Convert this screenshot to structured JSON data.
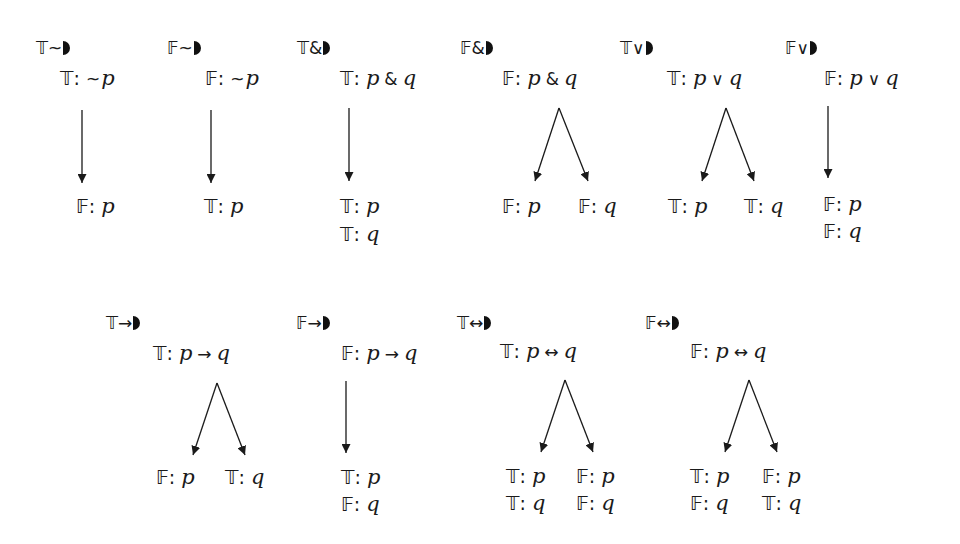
{
  "diagram": {
    "rules": [
      {
        "name": "T~",
        "sign": "𝕋",
        "connective": "~",
        "label_pos": [
          36,
          40
        ],
        "premise": {
          "sign": "𝕋",
          "text": "~p",
          "parts": [
            {
              "t": "~",
              "k": "op0"
            },
            {
              "t": "p",
              "k": "var"
            }
          ],
          "pos": [
            60,
            68
          ]
        },
        "branch": "linear",
        "arrow": {
          "x": 82,
          "y1": 110,
          "y2": 183
        },
        "conclusions": [
          {
            "sign": "𝔽",
            "var": "p",
            "pos": [
              76,
              196
            ]
          }
        ]
      },
      {
        "name": "F~",
        "sign": "𝔽",
        "connective": "~",
        "label_pos": [
          167,
          40
        ],
        "premise": {
          "sign": "𝔽",
          "text": "~p",
          "parts": [
            {
              "t": "~",
              "k": "op0"
            },
            {
              "t": "p",
              "k": "var"
            }
          ],
          "pos": [
            205,
            68
          ]
        },
        "branch": "linear",
        "arrow": {
          "x": 211,
          "y1": 110,
          "y2": 183
        },
        "conclusions": [
          {
            "sign": "𝕋",
            "var": "p",
            "pos": [
              204,
              196
            ]
          }
        ]
      },
      {
        "name": "T&",
        "sign": "𝕋",
        "connective": "&",
        "label_pos": [
          297,
          40
        ],
        "premise": {
          "sign": "𝕋",
          "text": "p & q",
          "parts": [
            {
              "t": "p",
              "k": "var"
            },
            {
              "t": "&",
              "k": "op"
            },
            {
              "t": "q",
              "k": "var"
            }
          ],
          "pos": [
            340,
            68
          ]
        },
        "branch": "linear",
        "arrow": {
          "x": 349,
          "y1": 108,
          "y2": 181
        },
        "conclusions": [
          {
            "sign": "𝕋",
            "var": "p",
            "pos": [
              340,
              196
            ]
          },
          {
            "sign": "𝕋",
            "var": "q",
            "pos": [
              340,
              224
            ]
          }
        ]
      },
      {
        "name": "F&",
        "sign": "𝔽",
        "connective": "&",
        "label_pos": [
          460,
          40
        ],
        "premise": {
          "sign": "𝔽",
          "text": "p & q",
          "parts": [
            {
              "t": "p",
              "k": "var"
            },
            {
              "t": "&",
              "k": "op"
            },
            {
              "t": "q",
              "k": "var"
            }
          ],
          "pos": [
            502,
            68
          ]
        },
        "branch": "split",
        "fork": {
          "apex": [
            559,
            108
          ],
          "left": [
            535,
            181
          ],
          "right": [
            588,
            181
          ]
        },
        "conclusions": [
          {
            "sign": "𝔽",
            "var": "p",
            "pos": [
              502,
              196
            ]
          },
          {
            "sign": "𝔽",
            "var": "q",
            "pos": [
              578,
              196
            ]
          }
        ]
      },
      {
        "name": "T∨",
        "sign": "𝕋",
        "connective": "∨",
        "label_pos": [
          620,
          40
        ],
        "premise": {
          "sign": "𝕋",
          "text": "p ∨ q",
          "parts": [
            {
              "t": "p",
              "k": "var"
            },
            {
              "t": "∨",
              "k": "op"
            },
            {
              "t": "q",
              "k": "var"
            }
          ],
          "pos": [
            667,
            68
          ]
        },
        "branch": "split",
        "fork": {
          "apex": [
            726,
            108
          ],
          "left": [
            702,
            181
          ],
          "right": [
            754,
            181
          ]
        },
        "conclusions": [
          {
            "sign": "𝕋",
            "var": "p",
            "pos": [
              668,
              196
            ]
          },
          {
            "sign": "𝕋",
            "var": "q",
            "pos": [
              744,
              196
            ]
          }
        ]
      },
      {
        "name": "F∨",
        "sign": "𝔽",
        "connective": "∨",
        "label_pos": [
          785,
          40
        ],
        "premise": {
          "sign": "𝔽",
          "text": "p ∨ q",
          "parts": [
            {
              "t": "p",
              "k": "var"
            },
            {
              "t": "∨",
              "k": "op"
            },
            {
              "t": "q",
              "k": "var"
            }
          ],
          "pos": [
            824,
            68
          ]
        },
        "branch": "linear",
        "arrow": {
          "x": 828,
          "y1": 106,
          "y2": 178
        },
        "conclusions": [
          {
            "sign": "𝔽",
            "var": "p",
            "pos": [
              823,
              194
            ]
          },
          {
            "sign": "𝔽",
            "var": "q",
            "pos": [
              823,
              221
            ]
          }
        ]
      },
      {
        "name": "T→",
        "sign": "𝕋",
        "connective": "→",
        "label_pos": [
          106,
          315
        ],
        "premise": {
          "sign": "𝕋",
          "text": "p → q",
          "parts": [
            {
              "t": "p",
              "k": "var"
            },
            {
              "t": "→",
              "k": "op"
            },
            {
              "t": "q",
              "k": "var"
            }
          ],
          "pos": [
            153,
            343
          ]
        },
        "branch": "split",
        "fork": {
          "apex": [
            217,
            383
          ],
          "left": [
            193,
            455
          ],
          "right": [
            245,
            455
          ]
        },
        "conclusions": [
          {
            "sign": "𝔽",
            "var": "p",
            "pos": [
              156,
              467
            ]
          },
          {
            "sign": "𝕋",
            "var": "q",
            "pos": [
              225,
              467
            ]
          }
        ]
      },
      {
        "name": "F→",
        "sign": "𝔽",
        "connective": "→",
        "label_pos": [
          296,
          315
        ],
        "premise": {
          "sign": "𝔽",
          "text": "p → q",
          "parts": [
            {
              "t": "p",
              "k": "var"
            },
            {
              "t": "→",
              "k": "op"
            },
            {
              "t": "q",
              "k": "var"
            }
          ],
          "pos": [
            341,
            343
          ]
        },
        "branch": "linear",
        "arrow": {
          "x": 346,
          "y1": 381,
          "y2": 453
        },
        "conclusions": [
          {
            "sign": "𝕋",
            "var": "p",
            "pos": [
              341,
              467
            ]
          },
          {
            "sign": "𝔽",
            "var": "q",
            "pos": [
              341,
              494
            ]
          }
        ]
      },
      {
        "name": "T↔",
        "sign": "𝕋",
        "connective": "↔",
        "label_pos": [
          457,
          315
        ],
        "premise": {
          "sign": "𝕋",
          "text": "p ↔ q",
          "parts": [
            {
              "t": "p",
              "k": "var"
            },
            {
              "t": "↔",
              "k": "op"
            },
            {
              "t": "q",
              "k": "var"
            }
          ],
          "pos": [
            500,
            341
          ]
        },
        "branch": "split",
        "fork": {
          "apex": [
            565,
            380
          ],
          "left": [
            541,
            452
          ],
          "right": [
            593,
            452
          ]
        },
        "conclusions": [
          {
            "sign": "𝕋",
            "var": "p",
            "pos": [
              506,
              466
            ]
          },
          {
            "sign": "𝕋",
            "var": "q",
            "pos": [
              506,
              493
            ]
          },
          {
            "sign": "𝔽",
            "var": "p",
            "pos": [
              576,
              466
            ]
          },
          {
            "sign": "𝔽",
            "var": "q",
            "pos": [
              576,
              493
            ]
          }
        ]
      },
      {
        "name": "F↔",
        "sign": "𝔽",
        "connective": "↔",
        "label_pos": [
          645,
          315
        ],
        "premise": {
          "sign": "𝔽",
          "text": "p ↔ q",
          "parts": [
            {
              "t": "p",
              "k": "var"
            },
            {
              "t": "↔",
              "k": "op"
            },
            {
              "t": "q",
              "k": "var"
            }
          ],
          "pos": [
            690,
            341
          ]
        },
        "branch": "split",
        "fork": {
          "apex": [
            749,
            380
          ],
          "left": [
            725,
            452
          ],
          "right": [
            777,
            452
          ]
        },
        "conclusions": [
          {
            "sign": "𝕋",
            "var": "p",
            "pos": [
              690,
              466
            ]
          },
          {
            "sign": "𝔽",
            "var": "q",
            "pos": [
              690,
              493
            ]
          },
          {
            "sign": "𝔽",
            "var": "p",
            "pos": [
              762,
              466
            ]
          },
          {
            "sign": "𝕋",
            "var": "q",
            "pos": [
              762,
              493
            ]
          }
        ]
      }
    ],
    "colors": {
      "ink": "#1a1a1a",
      "background": "#ffffff"
    }
  }
}
